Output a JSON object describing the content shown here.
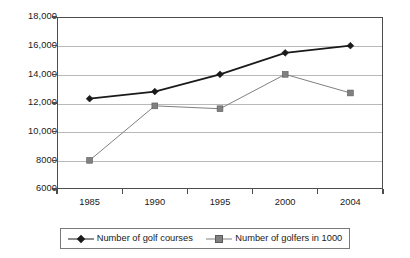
{
  "chart_data": {
    "type": "line",
    "title": "",
    "xlabel": "",
    "ylabel": "",
    "categories": [
      "1985",
      "1990",
      "1995",
      "2000",
      "2004"
    ],
    "ylim": [
      6000,
      18000
    ],
    "yticks": [
      6000,
      8000,
      10000,
      12000,
      14000,
      16000,
      18000
    ],
    "ytick_labels": [
      "6000",
      "8000",
      "10,000",
      "12,000",
      "14,000",
      "16,000",
      "18,000"
    ],
    "grid": true,
    "legend_position": "bottom",
    "series": [
      {
        "name": "Number of golf courses",
        "marker": "diamond",
        "color": "#1a1a1a",
        "values": [
          12300,
          12800,
          14000,
          15500,
          16000
        ]
      },
      {
        "name": "Number of golfers in 1000",
        "marker": "square",
        "color": "#808080",
        "values": [
          8000,
          11800,
          11600,
          14000,
          12700
        ]
      }
    ]
  },
  "colors": {
    "series1": "#1a1a1a",
    "series2": "#808080",
    "grid": "#b9b9b9",
    "axis": "#4d4d4d",
    "background": "#ffffff"
  }
}
